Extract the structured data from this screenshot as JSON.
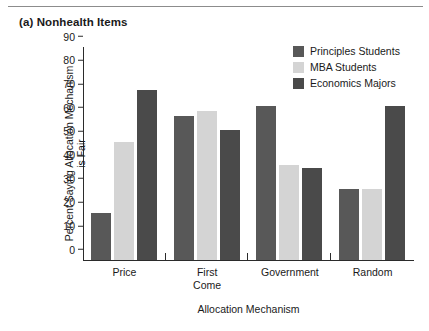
{
  "figure": {
    "panel_label": "(a) Nonhealth Items"
  },
  "chart_data": {
    "type": "bar",
    "title": "(a) Nonhealth Items",
    "xlabel": "Allocation Mechanism",
    "ylabel": "Percent Saying Allocation Mechanism is Fair",
    "ylabel_line1": "Percent Saying Allocation Mechanism",
    "ylabel_line2": "is Fair",
    "ylim": [
      0,
      90
    ],
    "yticks": [
      0,
      10,
      20,
      30,
      40,
      50,
      60,
      70,
      80,
      90
    ],
    "grid": false,
    "legend_position": "top-right",
    "categories": [
      "Price",
      "First Come",
      "Government",
      "Random"
    ],
    "category_labels": [
      {
        "line1": "Price",
        "line2": ""
      },
      {
        "line1": "First",
        "line2": "Come"
      },
      {
        "line1": "Government",
        "line2": ""
      },
      {
        "line1": "Random",
        "line2": ""
      }
    ],
    "series": [
      {
        "name": "Principles Students",
        "color": "#585858",
        "values": [
          20,
          61,
          65,
          30
        ]
      },
      {
        "name": "MBA Students",
        "color": "#d4d4d4",
        "values": [
          50,
          63,
          40,
          30
        ]
      },
      {
        "name": "Economics Majors",
        "color": "#4a4a4a",
        "values": [
          72,
          55,
          39,
          65
        ]
      }
    ]
  },
  "colors": {
    "axis": "#2b2b2b",
    "text": "#1a1a1a",
    "background": "#ffffff",
    "rule": "#8c8c8c"
  }
}
